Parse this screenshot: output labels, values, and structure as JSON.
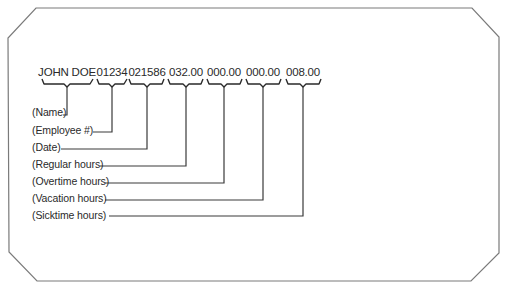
{
  "card": {
    "border_color": "#7a7a7a",
    "line_color": "#3a3a3a"
  },
  "record": {
    "fields": [
      {
        "key": "name",
        "value": "JOHN DOE",
        "label": "(Name)"
      },
      {
        "key": "employee",
        "value": "01234",
        "label": "(Employee #)"
      },
      {
        "key": "date",
        "value": "021586",
        "label": "(Date)"
      },
      {
        "key": "regular",
        "value": "032.00",
        "label": "(Regular hours)"
      },
      {
        "key": "overtime",
        "value": "000.00",
        "label": "(Overtime hours)"
      },
      {
        "key": "vacation",
        "value": "000.00",
        "label": "(Vacation hours)"
      },
      {
        "key": "sicktime",
        "value": "008.00",
        "label": "(Sicktime hours)"
      }
    ]
  }
}
